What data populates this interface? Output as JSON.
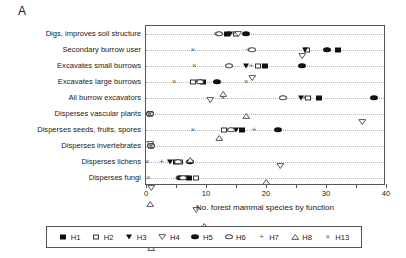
{
  "panel": {
    "letter": "A"
  },
  "chart_data": {
    "type": "scatter",
    "title": "",
    "xlabel": "No. forest mammal species by function",
    "ylabel": "",
    "xlim": [
      0,
      40
    ],
    "xticks": [
      0,
      5,
      10,
      15,
      20,
      25,
      30,
      35,
      40
    ],
    "xticklabels": [
      "0",
      "",
      "10",
      "",
      "20",
      "",
      "30",
      "",
      "40"
    ],
    "grid": true,
    "legend_position": "bottom",
    "categories": [
      "Digs, improves soil structure",
      "Secondary burrow user",
      "Excavates small burrows",
      "Excavates large burrows",
      "All burrow excavators",
      "Disperses vascular plants",
      "Disperses seeds, fruits, spores",
      "Disperses invertebrates",
      "Disperses lichens",
      "Disperses fungi"
    ],
    "series": [
      {
        "name": "H1",
        "marker": "filled-square",
        "values": [
          13.5,
          32.0,
          19.8,
          9.5,
          28.8,
          0.6,
          16.0,
          0.8,
          5.0,
          7.2
        ]
      },
      {
        "name": "H2",
        "marker": "open-square",
        "values": [
          15.0,
          26.8,
          18.6,
          7.8,
          27.0,
          0.6,
          13.0,
          0.8,
          5.7,
          8.3
        ]
      },
      {
        "name": "H3",
        "marker": "filled-down-triangle",
        "values": [
          14.0,
          26.5,
          16.7,
          8.8,
          25.8,
          0.6,
          15.0,
          0.8,
          4.0,
          6.6
        ]
      },
      {
        "name": "H4",
        "marker": "open-down-triangle",
        "values": [
          15.4,
          26.0,
          17.6,
          10.6,
          36.0,
          0.6,
          22.4,
          0.8,
          8.3,
          8.8
        ]
      },
      {
        "name": "H5",
        "marker": "filled-circle",
        "values": [
          16.6,
          30.2,
          26.0,
          11.9,
          38.0,
          0.6,
          22.0,
          0.8,
          7.4,
          5.6
        ]
      },
      {
        "name": "H6",
        "marker": "open-circle",
        "values": [
          12.2,
          17.6,
          13.8,
          9.0,
          22.8,
          0.6,
          14.2,
          0.8,
          5.4,
          6.2
        ]
      },
      {
        "name": "H7",
        "marker": "plus",
        "values": [
          14.6,
          17.0,
          17.5,
          8.4,
          26.4,
          0.6,
          18.0,
          0.8,
          2.6,
          5.2
        ]
      },
      {
        "name": "H8",
        "marker": "open-up-triangle",
        "values": [
          12.8,
          16.6,
          12.1,
          7.4,
          20.0,
          0.6,
          9.7,
          0.8,
          1.3,
          4.0
        ]
      },
      {
        "name": "H13",
        "marker": "cross",
        "values": [
          11.6,
          7.8,
          8.0,
          4.7,
          12.8,
          0.6,
          7.8,
          0.8,
          0.2,
          0.4
        ]
      }
    ],
    "extra_points": [
      {
        "category_index": 3,
        "series": "H13",
        "value": 16.7
      }
    ]
  },
  "legend": {
    "items": [
      {
        "label": "H1",
        "marker": "filled-square"
      },
      {
        "label": "H2",
        "marker": "open-square"
      },
      {
        "label": "H3",
        "marker": "filled-down-triangle"
      },
      {
        "label": "H4",
        "marker": "open-down-triangle"
      },
      {
        "label": "H5",
        "marker": "filled-circle"
      },
      {
        "label": "H6",
        "marker": "open-circle"
      },
      {
        "label": "H7",
        "marker": "plus"
      },
      {
        "label": "H8",
        "marker": "open-up-triangle"
      },
      {
        "label": "H13",
        "marker": "cross"
      }
    ]
  },
  "colors": {
    "marker_fill": "#111111",
    "marker_stroke": "#555555",
    "grid": "#b6b6b6",
    "axis": "#555555"
  }
}
